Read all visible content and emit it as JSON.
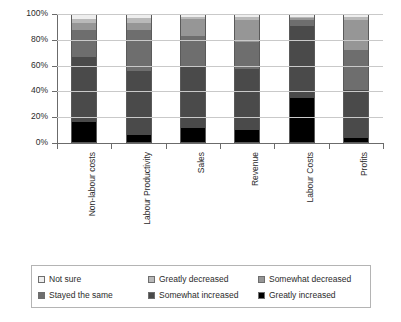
{
  "chart_data": {
    "type": "bar",
    "stacked": true,
    "stack_mode": "percent",
    "title": "",
    "subtitle": "",
    "xlabel": "",
    "ylabel": "",
    "ylim": [
      0,
      100
    ],
    "yticks": [
      0,
      20,
      40,
      60,
      80,
      100
    ],
    "ytick_labels": [
      "0%",
      "20%",
      "40%",
      "60%",
      "80%",
      "100%"
    ],
    "grid": true,
    "legend_position": "bottom",
    "categories": [
      "Non-labour costs",
      "Labour Productivity",
      "Sales",
      "Revenue",
      "Labour Costs",
      "Profits"
    ],
    "series": [
      {
        "name": "Greatly increased",
        "color": "#000000",
        "values": [
          16,
          6,
          12,
          10,
          35,
          4
        ]
      },
      {
        "name": "Somewhat increased",
        "color": "#4a4a4a",
        "values": [
          51,
          50,
          47,
          47,
          56,
          37
        ]
      },
      {
        "name": "Stayed the same",
        "color": "#6e6e6e",
        "values": [
          21,
          32,
          24,
          21,
          4,
          31
        ]
      },
      {
        "name": "Somewhat decreased",
        "color": "#969696",
        "values": [
          5,
          5,
          13,
          17,
          2,
          23
        ]
      },
      {
        "name": "Greatly decreased",
        "color": "#b9b9b9",
        "values": [
          3,
          4,
          2,
          3,
          1,
          3
        ]
      },
      {
        "name": "Not sure",
        "color": "#eeeeee",
        "values": [
          4,
          3,
          2,
          2,
          2,
          2
        ]
      }
    ]
  },
  "legend": {
    "items": [
      {
        "label": "Not sure",
        "color": "#eeeeee"
      },
      {
        "label": "Greatly decreased",
        "color": "#b9b9b9"
      },
      {
        "label": "Somewhat decreased",
        "color": "#969696"
      },
      {
        "label": "Stayed the same",
        "color": "#6e6e6e"
      },
      {
        "label": "Somewhat increased",
        "color": "#4a4a4a"
      },
      {
        "label": "Greatly increased",
        "color": "#000000"
      }
    ]
  },
  "axis": {
    "y_labels": [
      "100%",
      "80%",
      "60%",
      "40%",
      "20%",
      "0%"
    ]
  },
  "colors": {
    "axis": "#6b6b6b",
    "grid": "#c9c9c9",
    "text": "#2b2b2b",
    "background": "#ffffff",
    "legend_border": "#b4b4b4"
  }
}
